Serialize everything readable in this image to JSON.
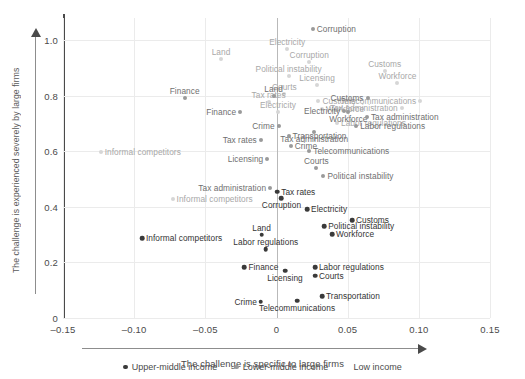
{
  "chart_data": {
    "type": "scatter",
    "title": "",
    "xlabel": "The challenge is specific to large firms",
    "ylabel": "The challenge is experienced severely by large firms",
    "xlim": [
      -0.15,
      0.15
    ],
    "ylim": [
      0,
      1.08
    ],
    "xticks": [
      "–0.15",
      "–0.10",
      "–0.05",
      "0",
      "0.05",
      "0.10",
      "0.15"
    ],
    "xtick_values": [
      -0.15,
      -0.1,
      -0.05,
      0,
      0.05,
      0.1,
      0.15
    ],
    "yticks": [
      "0",
      "0.2",
      "0.4",
      "0.6",
      "0.8",
      "1.0"
    ],
    "ytick_values": [
      0,
      0.2,
      0.4,
      0.6,
      0.8,
      1.0
    ],
    "grid": true,
    "legend_position": "bottom",
    "series": [
      {
        "name": "Upper-middle income",
        "key": "g-upper",
        "color": "#3a3a3a",
        "points": [
          {
            "label": "Informal competitors",
            "x": -0.0945,
            "y": 0.288,
            "side": "right"
          },
          {
            "label": "Land",
            "x": -0.0105,
            "y": 0.3,
            "side": "above"
          },
          {
            "label": "Labor regulations",
            "x": -0.0075,
            "y": 0.248,
            "side": "above"
          },
          {
            "label": "Finance",
            "x": -0.0225,
            "y": 0.182,
            "side": "right"
          },
          {
            "label": "Licensing",
            "x": 0.006,
            "y": 0.17,
            "side": "below"
          },
          {
            "label": "Labor regulations",
            "x": 0.027,
            "y": 0.182,
            "side": "right"
          },
          {
            "label": "Courts",
            "x": 0.027,
            "y": 0.152,
            "side": "right"
          },
          {
            "label": "Crime",
            "x": -0.011,
            "y": 0.058,
            "side": "left"
          },
          {
            "label": "Telecommunications",
            "x": 0.0145,
            "y": 0.062,
            "side": "below"
          },
          {
            "label": "Transportation",
            "x": 0.032,
            "y": 0.078,
            "side": "right"
          },
          {
            "label": "Corruption",
            "x": 0.0035,
            "y": 0.432,
            "side": "below"
          },
          {
            "label": "Electricity",
            "x": 0.0215,
            "y": 0.392,
            "side": "right"
          },
          {
            "label": "Customs",
            "x": 0.053,
            "y": 0.352,
            "side": "right"
          },
          {
            "label": "Political instability",
            "x": 0.0335,
            "y": 0.33,
            "side": "right"
          },
          {
            "label": "Workforce",
            "x": 0.039,
            "y": 0.302,
            "side": "right"
          },
          {
            "label": "Tax rates",
            "x": 0.0005,
            "y": 0.455,
            "side": "right"
          }
        ]
      },
      {
        "name": "Lower-middle income",
        "key": "g-lower",
        "color": "#9a9a9a",
        "points": [
          {
            "label": "Finance",
            "x": -0.0645,
            "y": 0.792,
            "side": "above"
          },
          {
            "label": "Land",
            "x": -0.002,
            "y": 0.8,
            "side": "above"
          },
          {
            "label": "Finance",
            "x": -0.0255,
            "y": 0.74,
            "side": "left"
          },
          {
            "label": "Crime",
            "x": 0.0015,
            "y": 0.69,
            "side": "left"
          },
          {
            "label": "Tax rates",
            "x": -0.011,
            "y": 0.64,
            "side": "left"
          },
          {
            "label": "Transportation",
            "x": 0.0085,
            "y": 0.655,
            "side": "right"
          },
          {
            "label": "Crime",
            "x": 0.01,
            "y": 0.618,
            "side": "right"
          },
          {
            "label": "Telecommunications",
            "x": 0.023,
            "y": 0.602,
            "side": "right"
          },
          {
            "label": "Licensing",
            "x": -0.0065,
            "y": 0.572,
            "side": "left"
          },
          {
            "label": "Courts",
            "x": 0.028,
            "y": 0.54,
            "side": "above"
          },
          {
            "label": "Political instability",
            "x": 0.033,
            "y": 0.512,
            "side": "right"
          },
          {
            "label": "Tax administration",
            "x": -0.0045,
            "y": 0.468,
            "side": "left"
          },
          {
            "label": "Electricity",
            "x": 0.0475,
            "y": 0.745,
            "side": "left"
          },
          {
            "label": "Customs",
            "x": 0.064,
            "y": 0.792,
            "side": "left"
          },
          {
            "label": "Workforce",
            "x": 0.0505,
            "y": 0.742,
            "side": "below"
          },
          {
            "label": "Tax administration",
            "x": 0.0635,
            "y": 0.722,
            "side": "right"
          },
          {
            "label": "Labor regulations",
            "x": 0.056,
            "y": 0.692,
            "side": "right"
          },
          {
            "label": "Tax administration",
            "x": 0.0265,
            "y": 0.668,
            "side": "below"
          },
          {
            "label": "Corruption",
            "x": 0.0255,
            "y": 1.04,
            "side": "right"
          }
        ]
      },
      {
        "name": "Low income",
        "key": "g-low",
        "color": "#d6d6d6",
        "points": [
          {
            "label": "Informal competitors",
            "x": -0.1235,
            "y": 0.598,
            "side": "right"
          },
          {
            "label": "Informal competitors",
            "x": -0.073,
            "y": 0.428,
            "side": "right"
          },
          {
            "label": "Land",
            "x": -0.039,
            "y": 0.932,
            "side": "above"
          },
          {
            "label": "Electricity",
            "x": 0.0075,
            "y": 0.968,
            "side": "above"
          },
          {
            "label": "Corruption",
            "x": 0.023,
            "y": 0.922,
            "side": "above"
          },
          {
            "label": "Political instability",
            "x": 0.0085,
            "y": 0.872,
            "side": "above"
          },
          {
            "label": "Licensing",
            "x": 0.0285,
            "y": 0.838,
            "side": "above"
          },
          {
            "label": "Customs",
            "x": 0.076,
            "y": 0.89,
            "side": "above"
          },
          {
            "label": "Workforce",
            "x": 0.085,
            "y": 0.845,
            "side": "above"
          },
          {
            "label": "Courts",
            "x": 0.0055,
            "y": 0.805,
            "side": "above"
          },
          {
            "label": "Tax rates",
            "x": -0.0055,
            "y": 0.778,
            "side": "above"
          },
          {
            "label": "Customs",
            "x": 0.0295,
            "y": 0.782,
            "side": "right"
          },
          {
            "label": "Telecommunications",
            "x": 0.101,
            "y": 0.782,
            "side": "left"
          },
          {
            "label": "Electricity",
            "x": 0.001,
            "y": 0.742,
            "side": "above"
          },
          {
            "label": "Workforce",
            "x": 0.032,
            "y": 0.752,
            "side": "right"
          },
          {
            "label": "Tax administration",
            "x": 0.088,
            "y": 0.755,
            "side": "left"
          },
          {
            "label": "Labor regulations",
            "x": 0.0425,
            "y": 0.702,
            "side": "right"
          }
        ]
      }
    ]
  },
  "legend": {
    "items": [
      {
        "label": "Upper-middle income",
        "key": "g-upper"
      },
      {
        "label": "Lower-middle income",
        "key": "g-lower"
      },
      {
        "label": "Low income",
        "key": "g-low"
      }
    ]
  }
}
